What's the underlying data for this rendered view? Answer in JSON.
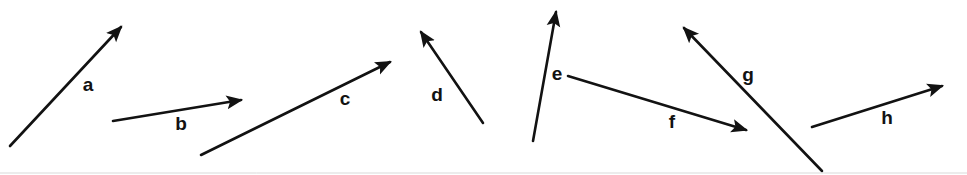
{
  "figure": {
    "width": 967,
    "height": 175,
    "background_color": "#ffffff",
    "stroke_color": "#121212",
    "label_color": "#121212",
    "baseline_color": "#d9d9d9"
  },
  "chart_data": {
    "type": "diagram",
    "title": "",
    "xlabel": "",
    "ylabel": "",
    "axis_visible": false,
    "grid": false,
    "legend": false,
    "units": "pixels",
    "xlim": [
      0,
      967
    ],
    "ylim": [
      0,
      175
    ],
    "arrowhead_style": "solid-filled-triangle",
    "arrows": [
      {
        "id": "a",
        "label": "a",
        "tail": [
          10,
          146
        ],
        "head": [
          121,
          27
        ],
        "label_pos": [
          88,
          86
        ],
        "dx": 111,
        "dy": -119,
        "length_px": 163,
        "angle_deg": 47,
        "direction": "up-right"
      },
      {
        "id": "b",
        "label": "b",
        "tail": [
          113,
          121
        ],
        "head": [
          241,
          100
        ],
        "label_pos": [
          181,
          125
        ],
        "dx": 128,
        "dy": -21,
        "length_px": 130,
        "angle_deg": 9,
        "direction": "right-slightly-up"
      },
      {
        "id": "c",
        "label": "c",
        "tail": [
          201,
          155
        ],
        "head": [
          390,
          62
        ],
        "label_pos": [
          345,
          100
        ],
        "dx": 189,
        "dy": -93,
        "length_px": 211,
        "angle_deg": 26,
        "direction": "up-right"
      },
      {
        "id": "d",
        "label": "d",
        "tail": [
          483,
          123
        ],
        "head": [
          421,
          32
        ],
        "label_pos": [
          437,
          96
        ],
        "dx": -62,
        "dy": -91,
        "length_px": 110,
        "angle_deg": 124,
        "direction": "up-left"
      },
      {
        "id": "e",
        "label": "e",
        "tail": [
          533,
          141
        ],
        "head": [
          556,
          12
        ],
        "label_pos": [
          557,
          75
        ],
        "dx": 23,
        "dy": -129,
        "length_px": 131,
        "angle_deg": 80,
        "direction": "up-slightly-right"
      },
      {
        "id": "f",
        "label": "f",
        "tail": [
          568,
          76
        ],
        "head": [
          746,
          130
        ],
        "label_pos": [
          672,
          123
        ],
        "dx": 178,
        "dy": 54,
        "length_px": 186,
        "angle_deg": -17,
        "direction": "right-down"
      },
      {
        "id": "g",
        "label": "g",
        "tail": [
          822,
          171
        ],
        "head": [
          684,
          28
        ],
        "label_pos": [
          748,
          76
        ],
        "dx": -138,
        "dy": -143,
        "length_px": 199,
        "angle_deg": 134,
        "direction": "up-left"
      },
      {
        "id": "h",
        "label": "h",
        "tail": [
          812,
          127
        ],
        "head": [
          942,
          86
        ],
        "label_pos": [
          887,
          119
        ],
        "dx": 130,
        "dy": -41,
        "length_px": 136,
        "angle_deg": 17,
        "direction": "right-up"
      }
    ],
    "baseline": {
      "visible": true,
      "y": 173,
      "x_start": 0,
      "x_end": 967
    }
  }
}
